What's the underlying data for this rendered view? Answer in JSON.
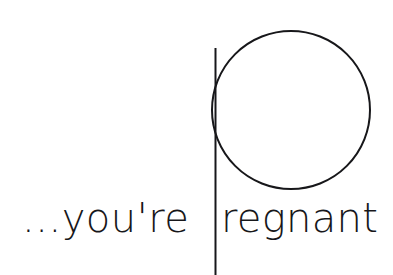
{
  "canvas": {
    "width": 393,
    "height": 275,
    "background_color": "#ffffff",
    "ink_color": "#17171a"
  },
  "artwork": {
    "kind": "typographic-image",
    "full_phrase": "...you're pregnant",
    "description": "Black line-art on white: an oversized outline capital P whose bowl is a large open circle and whose stem is a tall vertical rule running off the bottom edge; the small-type phrase sits on a baseline near the bottom so the giant P doubles as the p of pregnant.",
    "drop_cap": {
      "letter": "P",
      "style": "outline",
      "stroke_color": "#17171a",
      "stroke_width": 2,
      "stem": {
        "x": 215,
        "top_y": 48,
        "bottom_y": 275
      },
      "bowl": {
        "shape": "circle",
        "center_x": 291,
        "center_y": 110,
        "radius": 79,
        "filled": false
      }
    },
    "baseline_text": {
      "lead_segment": "...you're",
      "tail_segment": "regnant",
      "font_style": "geometric sans-serif, light weight, single-story a",
      "font_size_px": 40,
      "baseline_y": 232,
      "lead_x": 22,
      "tail_x": 221
    }
  }
}
